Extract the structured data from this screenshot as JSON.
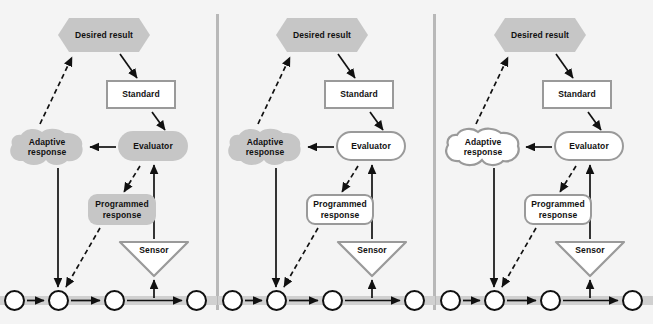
{
  "figure": {
    "background_color": "#f4f4f4",
    "width": 653,
    "height": 324,
    "panel_count": 3
  },
  "colors": {
    "gray_fill": "#c6c6c6",
    "outline_gray": "#9a9a9a",
    "track_gray": "#d0d0d0",
    "line_black": "#111111",
    "divider": "#b8b8b8",
    "background": "#f4f4f4"
  },
  "labels": {
    "desired_result": "Desired result",
    "standard": "Standard",
    "adaptive_response": "Adaptive\nresponse",
    "adaptive_response_line1": "Adaptive",
    "adaptive_response_line2": "response",
    "evaluator": "Evaluator",
    "programmed_response_line1": "Programmed",
    "programmed_response_line2": "response",
    "sensor": "Sensor"
  },
  "panels": [
    {
      "index": 1,
      "name": "panel-one",
      "nodes": {
        "desired_result": {
          "label": "Desired result",
          "shape": "hexagon",
          "fill": "gray"
        },
        "standard": {
          "label": "Standard",
          "shape": "rectangle",
          "fill": "white"
        },
        "adaptive_response": {
          "label": "Adaptive response",
          "shape": "blob",
          "fill": "gray"
        },
        "evaluator": {
          "label": "Evaluator",
          "shape": "rounded-rectangle",
          "fill": "gray"
        },
        "programmed_response": {
          "label": "Programmed response",
          "shape": "rounded-rectangle",
          "fill": "gray"
        },
        "sensor": {
          "label": "Sensor",
          "shape": "triangle-down",
          "fill": "white"
        }
      },
      "circles": 4
    },
    {
      "index": 2,
      "name": "panel-two",
      "nodes": {
        "desired_result": {
          "label": "Desired result",
          "shape": "hexagon",
          "fill": "gray"
        },
        "standard": {
          "label": "Standard",
          "shape": "rectangle",
          "fill": "white"
        },
        "adaptive_response": {
          "label": "Adaptive response",
          "shape": "blob",
          "fill": "gray"
        },
        "evaluator": {
          "label": "Evaluator",
          "shape": "rounded-rectangle",
          "fill": "white"
        },
        "programmed_response": {
          "label": "Programmed response",
          "shape": "rounded-rectangle",
          "fill": "white"
        },
        "sensor": {
          "label": "Sensor",
          "shape": "triangle-down",
          "fill": "white"
        }
      },
      "circles": 4
    },
    {
      "index": 3,
      "name": "panel-three",
      "nodes": {
        "desired_result": {
          "label": "Desired result",
          "shape": "hexagon",
          "fill": "gray"
        },
        "standard": {
          "label": "Standard",
          "shape": "rectangle",
          "fill": "white"
        },
        "adaptive_response": {
          "label": "Adaptive response",
          "shape": "blob",
          "fill": "white"
        },
        "evaluator": {
          "label": "Evaluator",
          "shape": "rounded-rectangle",
          "fill": "white"
        },
        "programmed_response": {
          "label": "Programmed response",
          "shape": "rounded-rectangle",
          "fill": "white"
        },
        "sensor": {
          "label": "Sensor",
          "shape": "triangle-down",
          "fill": "white"
        }
      },
      "circles": 4
    }
  ],
  "edges": [
    {
      "from": "adaptive_response",
      "to": "desired_result",
      "style": "dashed",
      "arrow": true
    },
    {
      "from": "desired_result",
      "to": "standard",
      "style": "solid",
      "arrow": true
    },
    {
      "from": "standard",
      "to": "evaluator",
      "style": "solid",
      "arrow": true
    },
    {
      "from": "evaluator",
      "to": "adaptive_response",
      "style": "solid",
      "arrow": true
    },
    {
      "from": "evaluator",
      "to": "programmed_response",
      "style": "dashed",
      "arrow": true
    },
    {
      "from": "adaptive_response",
      "to": "circle_2",
      "style": "solid",
      "arrow": true
    },
    {
      "from": "programmed_response",
      "to": "circle_2",
      "style": "dashed",
      "arrow": true
    },
    {
      "from": "sensor",
      "to": "evaluator",
      "style": "solid",
      "arrow": true
    },
    {
      "from": "track",
      "to": "sensor",
      "style": "solid",
      "arrow": true
    },
    {
      "from": "circle_1",
      "to": "circle_2",
      "style": "solid",
      "arrow": true
    },
    {
      "from": "circle_2",
      "to": "circle_3",
      "style": "solid",
      "arrow": true
    },
    {
      "from": "circle_3",
      "to": "circle_4",
      "style": "solid",
      "arrow": true
    }
  ]
}
